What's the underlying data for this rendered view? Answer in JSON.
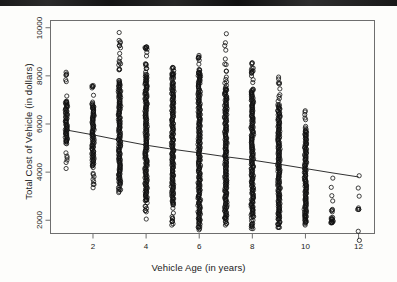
{
  "figure": {
    "background_color": "#fdfdfb",
    "ink_color": "#1a1a1a",
    "scan_artifact_label": "dark-scan-band-top"
  },
  "chart_data": {
    "type": "scatter",
    "title": "",
    "xlabel": "Vehicle Age (in years)",
    "ylabel": "Total Cost of Vehicle (in dollars)",
    "xlim": [
      0.4,
      12.6
    ],
    "ylim": [
      1450,
      10300
    ],
    "xticks": [
      2,
      4,
      6,
      8,
      10,
      12
    ],
    "xtick_labels": [
      "2",
      "4",
      "6",
      "8",
      "10",
      "12"
    ],
    "yticks": [
      2000,
      4000,
      6000,
      8000,
      10000
    ],
    "ytick_labels": [
      "2000",
      "4000",
      "6000",
      "8000",
      "10000"
    ],
    "grid": false,
    "legend": null,
    "marker": {
      "shape": "open-circle",
      "radius_px": 2.1,
      "stroke": "#111111",
      "fill": "none",
      "stroke_width": 0.8
    },
    "series": [
      {
        "name": "Vehicles",
        "type": "scatter",
        "note": "Heavily overplotted vertical bands at each integer vehicle age",
        "columns": [
          {
            "x": 1,
            "count": 190,
            "y_min": 4150,
            "y_max": 8150,
            "y_dense_min": 5150,
            "y_dense_max": 6950,
            "y_outliers": [
              8150,
              8080,
              6900,
              5750,
              5600,
              5300,
              4800,
              4400,
              4150
            ]
          },
          {
            "x": 2,
            "count": 260,
            "y_min": 3350,
            "y_max": 7600,
            "y_dense_min": 4200,
            "y_dense_max": 6850,
            "y_outliers": [
              7600,
              7550,
              3900,
              3700,
              3500,
              3350
            ]
          },
          {
            "x": 3,
            "count": 470,
            "y_min": 3150,
            "y_max": 9800,
            "y_dense_min": 3500,
            "y_dense_max": 7800,
            "y_outliers": [
              9800,
              8450,
              8250,
              3300,
              3150
            ]
          },
          {
            "x": 4,
            "count": 560,
            "y_min": 2050,
            "y_max": 9200,
            "y_dense_min": 2900,
            "y_dense_max": 8050,
            "y_outliers": [
              9200,
              9150,
              8500,
              8300,
              2400,
              2350,
              2050
            ]
          },
          {
            "x": 5,
            "count": 520,
            "y_min": 1800,
            "y_max": 8350,
            "y_dense_min": 2600,
            "y_dense_max": 7700,
            "y_outliers": [
              8350,
              8300,
              2500,
              2300,
              2150,
              1950,
              1800
            ]
          },
          {
            "x": 6,
            "count": 600,
            "y_min": 1600,
            "y_max": 8850,
            "y_dense_min": 2200,
            "y_dense_max": 8150,
            "y_outliers": [
              8850,
              8250,
              8100,
              2300,
              2000,
              1850,
              1700,
              1600
            ]
          },
          {
            "x": 7,
            "count": 540,
            "y_min": 1800,
            "y_max": 9750,
            "y_dense_min": 2200,
            "y_dense_max": 7450,
            "y_outliers": [
              9750,
              7750,
              7600,
              7450,
              2100,
              1950,
              1800
            ]
          },
          {
            "x": 8,
            "count": 470,
            "y_min": 1650,
            "y_max": 8550,
            "y_dense_min": 2100,
            "y_dense_max": 7450,
            "y_outliers": [
              8550,
              8500,
              8150,
              2000,
              1850,
              1650
            ]
          },
          {
            "x": 9,
            "count": 400,
            "y_min": 1700,
            "y_max": 7950,
            "y_dense_min": 2000,
            "y_dense_max": 6800,
            "y_outliers": [
              7950,
              6950,
              2200,
              2050,
              1900,
              1700
            ]
          },
          {
            "x": 10,
            "count": 300,
            "y_min": 1800,
            "y_max": 6550,
            "y_dense_min": 2050,
            "y_dense_max": 5700,
            "y_outliers": [
              6550,
              6250,
              5900,
              2200,
              2000,
              1850,
              1800
            ]
          },
          {
            "x": 11,
            "count": 30,
            "y_min": 1900,
            "y_max": 3750,
            "y_dense_min": 1900,
            "y_dense_max": 2100,
            "y_outliers": [
              3750,
              2450,
              2400,
              2350,
              2050,
              1950,
              1900
            ]
          },
          {
            "x": 12,
            "count": 4,
            "y_min": 2450,
            "y_max": 3850,
            "y_dense_min": 0,
            "y_dense_max": 0,
            "y_outliers": [
              3850,
              3000,
              2450
            ]
          }
        ]
      },
      {
        "name": "Trend line",
        "type": "line",
        "x": [
          1,
          2,
          3,
          4,
          5,
          6,
          7,
          8,
          9,
          10,
          11,
          12
        ],
        "values": [
          5750,
          5550,
          5330,
          5120,
          4950,
          4800,
          4640,
          4500,
          4330,
          4150,
          3970,
          3800
        ],
        "stroke": "#1a1a1a",
        "stroke_width": 0.9
      }
    ]
  }
}
